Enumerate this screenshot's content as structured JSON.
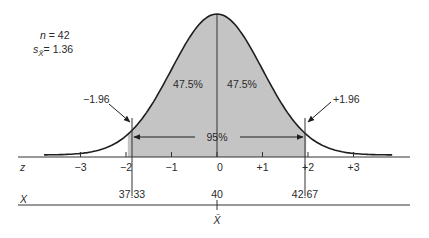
{
  "chart_data": {
    "type": "area",
    "title": "",
    "distribution": "normal",
    "stats": {
      "n_label": "n",
      "n": "42",
      "se_label": "s",
      "se_sub": "X̄",
      "se": "1.36",
      "n_text": "n = 42",
      "se_text": "= 1.36"
    },
    "shaded_region": {
      "z_from": -1.96,
      "z_to": 1.96,
      "percent_total": "95%",
      "left_half": "47.5%",
      "right_half": "47.5%"
    },
    "annotations": {
      "left_z": "−1.96",
      "right_z": "+1.96"
    },
    "z_axis": {
      "label": "z",
      "ticks": [
        "−3",
        "−2",
        "−1",
        "0",
        "+1",
        "+2",
        "+3"
      ],
      "values": [
        -3,
        -2,
        -1,
        0,
        1,
        2,
        3
      ]
    },
    "x_axis": {
      "label": "X",
      "ticks": [
        "37.33",
        "40",
        "42.67"
      ],
      "values": [
        37.33,
        40,
        42.67
      ],
      "mean_label": "X̄"
    },
    "colors": {
      "fill": "#c4c4c4",
      "line": "#1e1e1e"
    }
  }
}
